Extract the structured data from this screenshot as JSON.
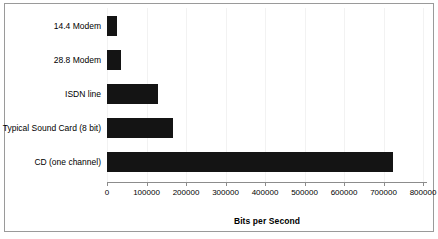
{
  "chart_data": {
    "type": "bar",
    "orientation": "horizontal",
    "title": "",
    "xlabel": "Bits per Second",
    "ylabel": "",
    "categories": [
      "14.4 Modem",
      "28.8 Modem",
      "ISDN line",
      "Typical Sound Card (8 bit)",
      "CD (one channel)"
    ],
    "values": [
      24000,
      36000,
      128000,
      165000,
      716000
    ],
    "xlim": [
      0,
      800000
    ],
    "xticks": [
      0,
      100000,
      200000,
      300000,
      400000,
      500000,
      600000,
      700000,
      800000
    ],
    "xtick_labels": [
      "0",
      "100000",
      "200000",
      "300000",
      "400000",
      "500000",
      "600000",
      "700000",
      "800000"
    ],
    "grid": false,
    "legend": false,
    "bar_color": "#141414",
    "axis_color": "#8c8c8c",
    "background": "#ffffff"
  }
}
